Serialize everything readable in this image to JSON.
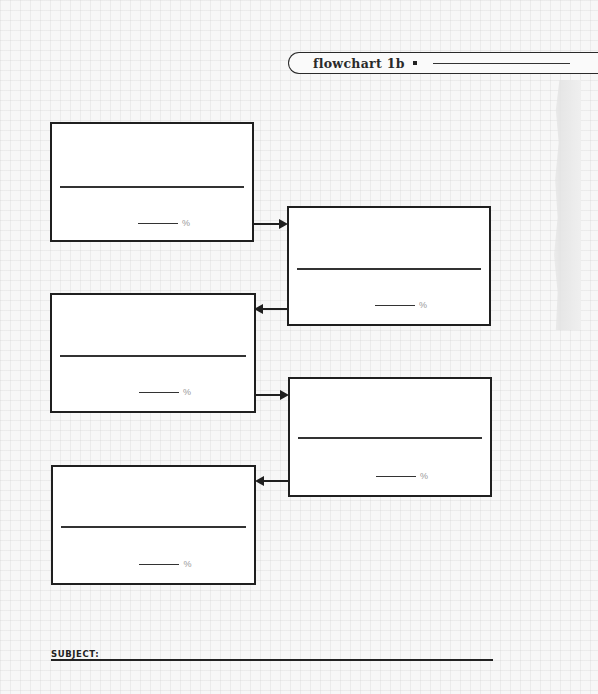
{
  "header": {
    "title": "flowchart 1b",
    "bullet_icon": "square-bullet",
    "title_blank": ""
  },
  "boxes": [
    {
      "id": 1,
      "text": "",
      "percent_value": "",
      "percent_symbol": "%"
    },
    {
      "id": 2,
      "text": "",
      "percent_value": "",
      "percent_symbol": "%"
    },
    {
      "id": 3,
      "text": "",
      "percent_value": "",
      "percent_symbol": "%"
    },
    {
      "id": 4,
      "text": "",
      "percent_value": "",
      "percent_symbol": "%"
    },
    {
      "id": 5,
      "text": "",
      "percent_value": "",
      "percent_symbol": "%"
    }
  ],
  "arrows": [
    {
      "from": 1,
      "to": 2,
      "direction": "right"
    },
    {
      "from": 2,
      "to": 3,
      "direction": "left"
    },
    {
      "from": 3,
      "to": 4,
      "direction": "right"
    },
    {
      "from": 4,
      "to": 5,
      "direction": "left"
    }
  ],
  "footer": {
    "subject_label": "SUBJECT:",
    "subject_value": ""
  },
  "colors": {
    "ink": "#1f1f1f",
    "paper": "#f7f7f7",
    "percent_gray": "#999999"
  }
}
